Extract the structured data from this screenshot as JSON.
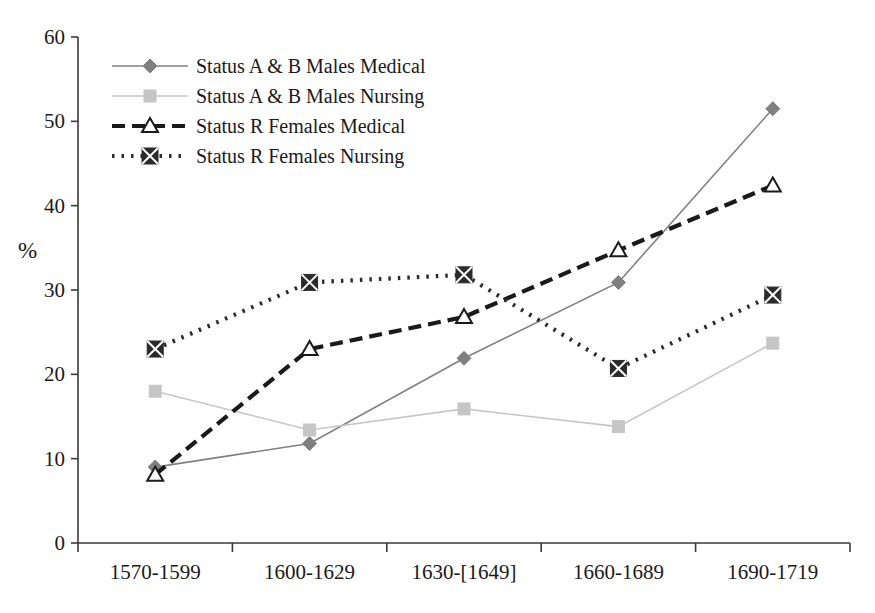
{
  "chart_data": {
    "type": "line",
    "title": "",
    "xlabel": "",
    "ylabel": "%",
    "ylim": [
      0,
      60
    ],
    "ytick_step": 10,
    "yticks": [
      "0",
      "10",
      "20",
      "30",
      "40",
      "50",
      "60"
    ],
    "grid": false,
    "legend_position": "top-left inside plot",
    "categories": [
      "1570-1599",
      "1600-1629",
      "1630-[1649]",
      "1660-1689",
      "1690-1719"
    ],
    "series": [
      {
        "name": "Status A & B Males Medical",
        "values": [
          9.0,
          11.8,
          21.9,
          30.9,
          51.5
        ],
        "color": "#808080",
        "marker": "diamond",
        "line_style": "solid"
      },
      {
        "name": "Status A & B Males Nursing",
        "values": [
          18.0,
          13.4,
          15.9,
          13.8,
          23.7
        ],
        "color": "#c6c6c6",
        "marker": "square",
        "line_style": "solid"
      },
      {
        "name": "Status R Females Medical",
        "values": [
          8.1,
          23.0,
          26.8,
          34.7,
          42.4
        ],
        "color": "#1a1a1a",
        "marker": "triangle-open",
        "line_style": "dashed"
      },
      {
        "name": "Status R Females Nursing",
        "values": [
          23.0,
          30.9,
          31.8,
          20.7,
          29.4
        ],
        "color": "#2b2b2b",
        "marker": "square-x",
        "line_style": "dotted"
      }
    ]
  },
  "axis": {
    "y_label": "%"
  },
  "legend": {
    "entries": [
      {
        "label": "Status A & B Males Medical"
      },
      {
        "label": "Status A & B Males Nursing"
      },
      {
        "label": "Status R Females Medical"
      },
      {
        "label": "Status R Females Nursing"
      }
    ]
  }
}
